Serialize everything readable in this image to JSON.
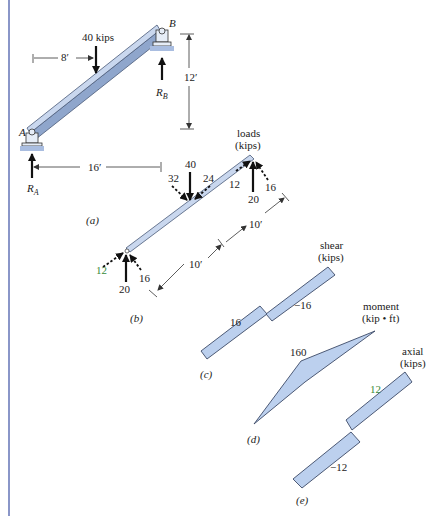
{
  "figure": {
    "panel_a": {
      "caption": "(a)",
      "load_label": "40 kips",
      "dim_horizontal_load": "8′",
      "dim_horizontal_span": "16′",
      "dim_vertical_rise": "12′",
      "support_left_label": "A",
      "support_right_label": "B",
      "reaction_left": "R",
      "reaction_left_sub": "A",
      "reaction_right": "R",
      "reaction_right_sub": "B"
    },
    "panel_b": {
      "caption": "(b)",
      "title_line1": "loads",
      "title_line2": "(kips)",
      "mid_vertical": "40",
      "mid_normal": "32",
      "mid_axial": "24",
      "right_axial": "12",
      "right_vertical": "20",
      "right_normal": "16",
      "left_axial": "12",
      "left_vertical": "20",
      "left_normal": "16",
      "dim_upper": "10′",
      "dim_lower": "10′"
    },
    "panel_c": {
      "caption": "(c)",
      "title_line1": "shear",
      "title_line2": "(kips)",
      "value_left": "16",
      "value_right": "−16"
    },
    "panel_d": {
      "caption": "(d)",
      "title_line1": "moment",
      "title_line2": "(kip • ft)",
      "value_peak": "160"
    },
    "panel_e": {
      "caption": "(e)",
      "title_line1": "axial",
      "title_line2": "(kips)",
      "value_upper": "12",
      "value_lower": "−12"
    },
    "colors": {
      "diagram_fill": "#bcd0ee",
      "beam_fill": "#c9d7ee",
      "frame_line": "#8a96c8",
      "green_label": "#3a8a3a"
    }
  }
}
